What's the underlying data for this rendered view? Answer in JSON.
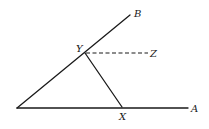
{
  "diagram": {
    "type": "geometry",
    "points": {
      "O": {
        "x": 17,
        "y": 108
      },
      "A": {
        "x": 188,
        "y": 108
      },
      "B": {
        "x": 130,
        "y": 15
      },
      "Y": {
        "x": 85,
        "y": 53
      },
      "X": {
        "x": 122,
        "y": 107
      },
      "Z": {
        "x": 148,
        "y": 53
      }
    },
    "labels": {
      "A": "A",
      "B": "B",
      "X": "X",
      "Y": "Y",
      "Z": "Z"
    },
    "segments": [
      {
        "name": "ray-OA",
        "from": "O",
        "to": "A",
        "style": "solid"
      },
      {
        "name": "ray-OB",
        "from": "O",
        "to": "B",
        "style": "solid"
      },
      {
        "name": "segment-YX",
        "from": "Y",
        "to": "X",
        "style": "solid"
      },
      {
        "name": "segment-YZ",
        "from": "Y",
        "to": "Z",
        "style": "dashed"
      }
    ]
  }
}
